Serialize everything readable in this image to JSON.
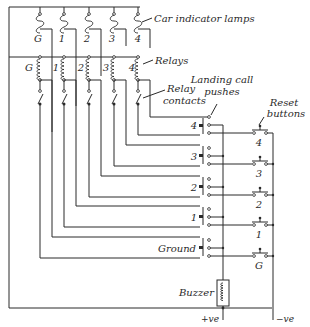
{
  "diagram": {
    "labels": {
      "car_indicator_lamps": "Car indicator lamps",
      "relays": "Relays",
      "relay_contacts_1": "Relay",
      "relay_contacts_2": "contacts",
      "landing_call_1": "Landing call",
      "landing_call_2": "pushes",
      "reset_1": "Reset",
      "reset_2": "buttons",
      "ground": "Ground",
      "buzzer": "Buzzer",
      "plus_ve": "+ve",
      "minus_ve": "−ve"
    },
    "lamps": [
      "G",
      "1",
      "2",
      "3",
      "4"
    ],
    "relays": [
      "G",
      "1",
      "2",
      "3",
      "4"
    ],
    "landing_pushes": [
      "4",
      "3",
      "2",
      "1"
    ],
    "reset_buttons": [
      "4",
      "3",
      "2",
      "1",
      "G"
    ]
  }
}
